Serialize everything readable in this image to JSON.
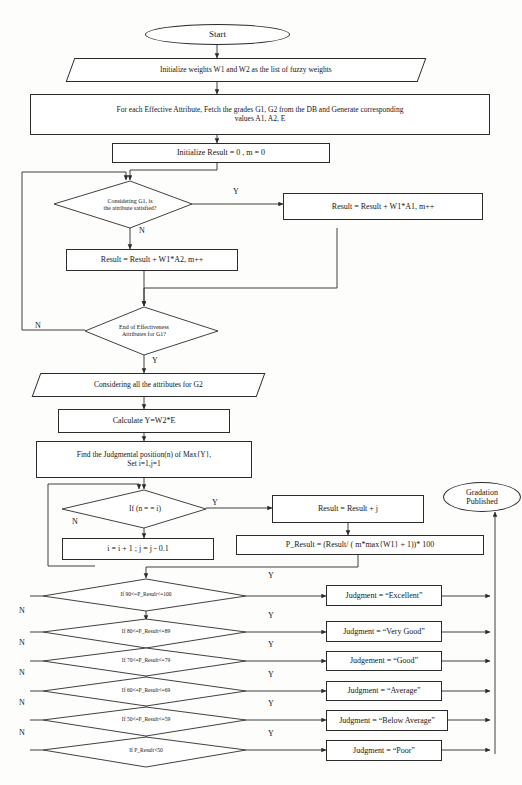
{
  "diagram": {
    "type": "flowchart",
    "canvas": {
      "width": 522,
      "height": 785
    },
    "stroke_color": "#2b2b2b",
    "background_color": "#fdfdfc",
    "text_color": "#151515"
  },
  "nodes": {
    "start": {
      "label": "Start",
      "shape": "terminator"
    },
    "init_weights": {
      "label": "Initialize weights W1 and W2 as the list of fuzzy weights",
      "shape": "io"
    },
    "fetch_grades": {
      "line1": "For each Effective Attribute, Fetch the grades G1, G2 from the DB and Generate corresponding",
      "line2": "values A1, A2, E",
      "shape": "process"
    },
    "init_result": {
      "label": "Initialize Result = 0 , m = 0",
      "shape": "process"
    },
    "decide_g1": {
      "line1": "Considering G1, is",
      "line2": "the attribute satisfied?",
      "shape": "decision"
    },
    "result_a1": {
      "label": "Result = Result + W1*A1, m++",
      "shape": "process"
    },
    "result_a2": {
      "label": "Result = Result + W1*A2, m++",
      "shape": "process"
    },
    "decide_end_attrs": {
      "line1": "End of Effectiveness",
      "line2": "Attributes for G1?",
      "shape": "decision"
    },
    "consider_g2": {
      "label": "Considering all the attributes for G2",
      "shape": "io"
    },
    "calculate_y": {
      "label": "Calculate Y=W2*E",
      "shape": "process"
    },
    "find_judgmental": {
      "line1": "Find the Judgmental position(n) of Max{Y},",
      "line2": "Set i=1,j=1",
      "shape": "process"
    },
    "decide_n_eq_i": {
      "label": "If (n = = i)",
      "shape": "decision"
    },
    "increment": {
      "label": "i = i + 1 ; j = j - 0.1",
      "shape": "process"
    },
    "result_plus_j": {
      "label": "Result = Result + j",
      "shape": "process"
    },
    "p_result": {
      "label": "P_Result = (Result/ ( m*max{W1} + 1))* 100",
      "shape": "process"
    },
    "gradation_published": {
      "line1": "Gradation",
      "line2": "Published",
      "shape": "terminator"
    }
  },
  "grading": {
    "rows": [
      {
        "condition": "If 90<=P_Result<=100",
        "judgment": "Judgment = “Excellent”",
        "yes_label": "Y",
        "no_label": "N"
      },
      {
        "condition": "If 80<=P_Result<=89",
        "judgment": "Judgment = “Very Good”",
        "yes_label": "Y",
        "no_label": "N"
      },
      {
        "condition": "If 70<=P_Result<=79",
        "judgment": "Judgement = “Good”",
        "yes_label": "Y",
        "no_label": "N"
      },
      {
        "condition": "If 60<=P_Result<=69",
        "judgment": "Judgment = “Average”",
        "yes_label": "Y",
        "no_label": "N"
      },
      {
        "condition": "If 50<=P_Result<=59",
        "judgment": "Judgment = “Below Average”",
        "yes_label": "Y",
        "no_label": "N"
      },
      {
        "condition": "If P_Result<50",
        "judgment": "Judgment = “Poor”",
        "yes_label": "Y",
        "no_label": ""
      }
    ]
  },
  "edge_labels": {
    "g1_yes": "Y",
    "g1_no": "N",
    "end_attrs_no": "N",
    "end_attrs_yes": "Y",
    "n_eq_i_yes": "Y",
    "n_eq_i_no": "N"
  }
}
